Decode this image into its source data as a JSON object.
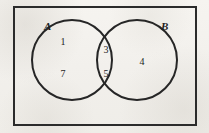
{
  "diagram": {
    "type": "venn-diagram",
    "universe": {
      "shape": "rectangle",
      "border_color": "#2b2b2b"
    },
    "background_color": "#f4f2ee",
    "ink_color": "#262626",
    "sets": [
      {
        "id": "A",
        "label": "A",
        "position": "left"
      },
      {
        "id": "B",
        "label": "B",
        "position": "right"
      }
    ],
    "regions": [
      {
        "id": "a-only-top",
        "region": "A only",
        "value": "1"
      },
      {
        "id": "a-only-bottom",
        "region": "A only",
        "value": "7"
      },
      {
        "id": "intersection-top",
        "region": "A intersect B",
        "value": "3"
      },
      {
        "id": "intersection-bottom",
        "region": "A intersect B",
        "value": "5"
      },
      {
        "id": "b-only",
        "region": "B only",
        "value": "4"
      }
    ]
  }
}
